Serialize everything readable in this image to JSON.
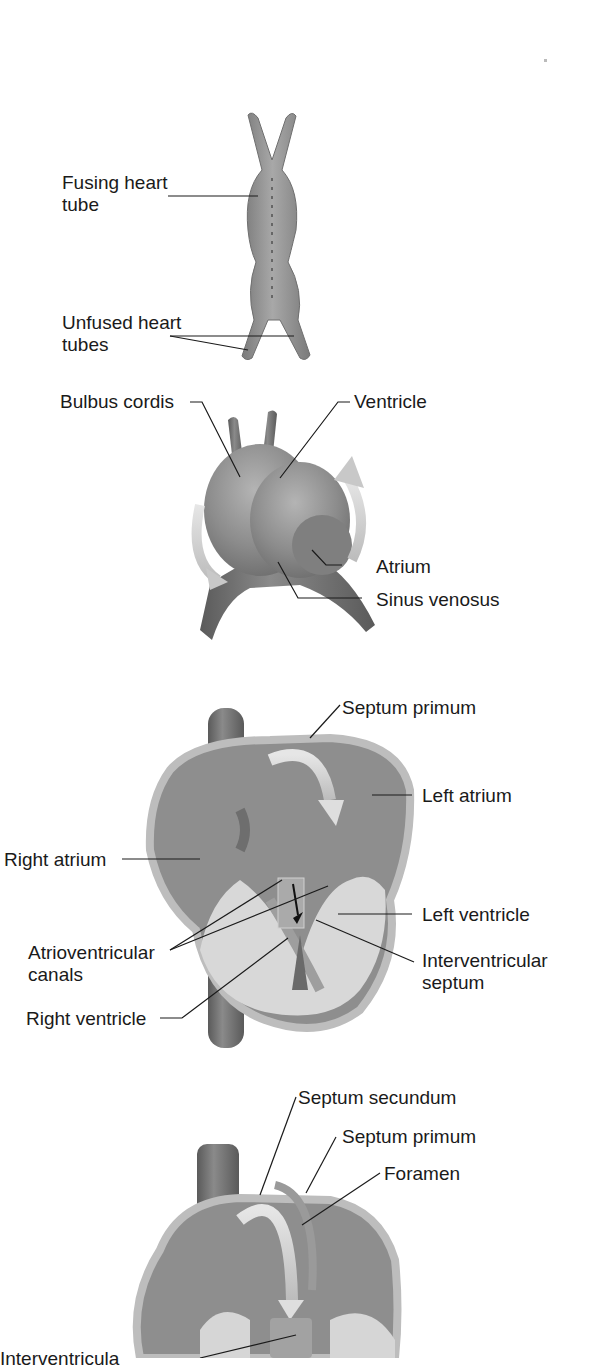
{
  "colors": {
    "background": "#ffffff",
    "tissue": "#8a8a8a",
    "tissue_dark": "#6e6e6e",
    "tissue_light": "#bdbdbd",
    "wall_highlight": "#d6d6d6",
    "arrow_light": "#cfcfcf",
    "leader_line": "#1a1a1a",
    "text": "#1a1a1a"
  },
  "stages": [
    {
      "id": "stage-1",
      "subject": "fusing heart tube",
      "labels": [
        {
          "text": "Fusing heart",
          "text2": "tube"
        },
        {
          "text": "Unfused heart",
          "text2": "tubes"
        }
      ]
    },
    {
      "id": "stage-2",
      "subject": "looping heart",
      "labels": [
        {
          "text": "Bulbus cordis"
        },
        {
          "text": "Ventricle"
        },
        {
          "text": "Atrium"
        },
        {
          "text": "Sinus venosus"
        }
      ]
    },
    {
      "id": "stage-3",
      "subject": "septation of heart chambers",
      "labels": [
        {
          "text": "Septum primum"
        },
        {
          "text": "Left atrium"
        },
        {
          "text": "Right atrium"
        },
        {
          "text": "Left ventricle"
        },
        {
          "text": "Atrioventricular",
          "text2": "canals"
        },
        {
          "text": "Interventricular",
          "text2": "septum"
        },
        {
          "text": "Right ventricle"
        }
      ]
    },
    {
      "id": "stage-4",
      "subject": "foramen ovale formation",
      "labels": [
        {
          "text": "Septum secundum"
        },
        {
          "text": "Septum primum"
        },
        {
          "text": "Foramen"
        },
        {
          "text": "Interventricula",
          "note": "cut off at bottom edge"
        }
      ]
    }
  ]
}
